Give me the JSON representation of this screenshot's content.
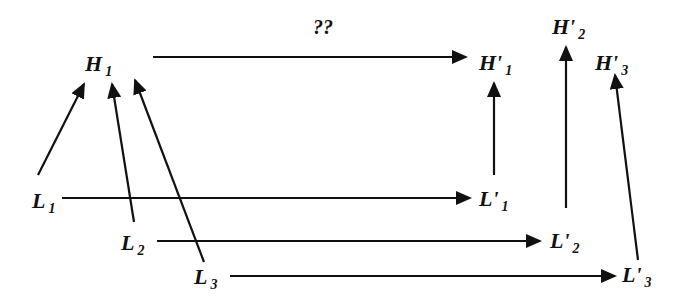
{
  "diagram": {
    "question_label": "??",
    "nodes": {
      "H1": {
        "base": "H",
        "sub": "1"
      },
      "Hp1": {
        "base": "H'",
        "sub": "1"
      },
      "Hp2": {
        "base": "H'",
        "sub": "2"
      },
      "Hp3": {
        "base": "H'",
        "sub": "3"
      },
      "L1": {
        "base": "L",
        "sub": "1"
      },
      "L2": {
        "base": "L",
        "sub": "2"
      },
      "L3": {
        "base": "L",
        "sub": "3"
      },
      "Lp1": {
        "base": "L'",
        "sub": "1"
      },
      "Lp2": {
        "base": "L'",
        "sub": "2"
      },
      "Lp3": {
        "base": "L'",
        "sub": "3"
      }
    },
    "edges": [
      {
        "from": "H1",
        "to": "Hp1",
        "label": "??"
      },
      {
        "from": "L1",
        "to": "H1"
      },
      {
        "from": "L2",
        "to": "H1"
      },
      {
        "from": "L3",
        "to": "H1"
      },
      {
        "from": "L1",
        "to": "Lp1"
      },
      {
        "from": "L2",
        "to": "Lp2"
      },
      {
        "from": "L3",
        "to": "Lp3"
      },
      {
        "from": "Lp1",
        "to": "Hp1"
      },
      {
        "from": "Lp2",
        "to": "Hp2"
      },
      {
        "from": "Lp3",
        "to": "Hp3"
      }
    ],
    "colors": {
      "stroke": "#111111",
      "background": "#ffffff"
    }
  }
}
